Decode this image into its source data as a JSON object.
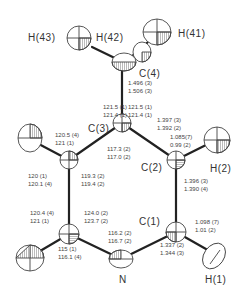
{
  "atoms": {
    "H43": "H(43)",
    "H42": "H(42)",
    "H41": "H(41)",
    "C4": "C(4)",
    "C3": "C(3)",
    "C2": "C(2)",
    "H2": "H(2)",
    "C1": "C(1)",
    "N": "N",
    "H1": "H(1)"
  },
  "bond_lengths": {
    "C4_C3": [
      "1.496 (3)",
      "1.506 (3)"
    ],
    "C3_C2": [
      "1.397 (3)",
      "1.392 (2)"
    ],
    "C2_H2": [
      "1.085(7)",
      "0.99 (2)"
    ],
    "C2_C1": [
      "1.396 (3)",
      "1.390 (4)"
    ],
    "C1_H1": [
      "1.098 (7)",
      "1.01 (2)"
    ],
    "C1_N": [
      "1.337 (2)",
      "1.344 (3)"
    ]
  },
  "angles": {
    "C3_left_top": [
      "121.5 (1)",
      "121.4 (1)"
    ],
    "C3_right_top": [
      "121.5 (1)",
      "121.4 (1)"
    ],
    "C3_bottom": [
      "117.3 (2)",
      "117.0 (2)"
    ],
    "C5_top": [
      "120.5 (4)",
      "121 (1)"
    ],
    "C5_left": [
      "120 (1)",
      "120.1 (4)"
    ],
    "C5_right": [
      "119.3 (2)",
      "119.4 (2)"
    ],
    "C6_left": [
      "120.4 (4)",
      "121 (1)"
    ],
    "C6_right": [
      "124.0 (2)",
      "123.7 (2)"
    ],
    "C6_bottom": [
      "115 (1)",
      "116.1 (4)"
    ],
    "N_angle": [
      "116.2 (2)",
      "116.7 (2)"
    ]
  },
  "colors": {
    "bond": "#222222",
    "atom_outline": "#444444",
    "hatch": "#555555"
  }
}
